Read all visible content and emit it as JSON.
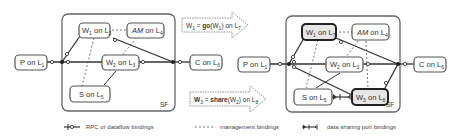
{
  "diagram": {
    "left_panel": {
      "container_label": "SF",
      "nodes": [
        {
          "id": "P",
          "name": "P",
          "loc": "1"
        },
        {
          "id": "W1",
          "name": "W",
          "name_sub": "1",
          "loc": "2"
        },
        {
          "id": "AM",
          "name": "AM",
          "loc": "4"
        },
        {
          "id": "W2",
          "name": "W",
          "name_sub": "2",
          "loc": "3"
        },
        {
          "id": "S",
          "name": "S",
          "loc": "5"
        },
        {
          "id": "C",
          "name": "C",
          "loc": "6"
        }
      ]
    },
    "transformations": [
      {
        "lhs": "W",
        "lhs_sub": "1",
        "op": "go",
        "arg": "W",
        "arg_sub": "1",
        "loc": "7"
      },
      {
        "lhs": "W",
        "lhs_sub": "3",
        "op": "share",
        "arg": "W",
        "arg_sub": "2",
        "loc": "8"
      }
    ],
    "right_panel": {
      "container_label": "SF",
      "nodes": [
        {
          "id": "P",
          "name": "P",
          "loc": "1"
        },
        {
          "id": "W1",
          "name": "W",
          "name_sub": "1",
          "loc": "7",
          "highlighted": true
        },
        {
          "id": "AM",
          "name": "AM",
          "loc": "4"
        },
        {
          "id": "W2",
          "name": "W",
          "name_sub": "2",
          "loc": "3"
        },
        {
          "id": "S",
          "name": "S",
          "loc": "5"
        },
        {
          "id": "W3",
          "name": "W",
          "name_sub": "3",
          "loc": "8",
          "highlighted": true
        },
        {
          "id": "C",
          "name": "C",
          "loc": "6"
        }
      ]
    },
    "legend": [
      {
        "symbol": "rpc-binding",
        "label": "RPC or dataflow  bindings"
      },
      {
        "symbol": "management-binding",
        "label": "management bindings"
      },
      {
        "symbol": "data-sharing-binding",
        "label": "data sharing port bindings"
      }
    ],
    "text": {
      "on": "on",
      "L": "L",
      "eq": " = ",
      "open": "(",
      "close": ")"
    },
    "colors": {
      "stroke": "#333333",
      "node_border": "#555555",
      "container_border": "#666666",
      "highlight_fill": "#e6e6e6"
    }
  }
}
